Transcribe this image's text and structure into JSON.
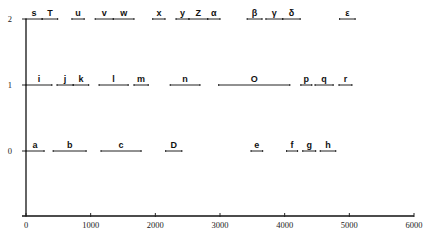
{
  "chart_data": {
    "type": "gantt-interval",
    "title": "",
    "xlabel": "",
    "ylabel": "",
    "xlim": [
      0,
      6000
    ],
    "ylim": [
      -1,
      2
    ],
    "grid": false,
    "x_ticks": [
      0,
      1000,
      2000,
      3000,
      4000,
      5000,
      6000
    ],
    "y_ticks": [
      0,
      1,
      2
    ],
    "levels": [
      {
        "y": 2,
        "intervals": [
          {
            "label": "s",
            "start": 0,
            "end": 250
          },
          {
            "label": "T",
            "start": 250,
            "end": 490
          },
          {
            "label": "u",
            "start": 710,
            "end": 900
          },
          {
            "label": "v",
            "start": 1070,
            "end": 1350
          },
          {
            "label": "w",
            "start": 1350,
            "end": 1670
          },
          {
            "label": "x",
            "start": 1960,
            "end": 2150
          },
          {
            "label": "y",
            "start": 2320,
            "end": 2520
          },
          {
            "label": "Z",
            "start": 2520,
            "end": 2810
          },
          {
            "label": "α",
            "start": 2810,
            "end": 3000
          },
          {
            "label": "β",
            "start": 3420,
            "end": 3650
          },
          {
            "label": "γ",
            "start": 3710,
            "end": 3970
          },
          {
            "label": "δ",
            "start": 3970,
            "end": 4240
          },
          {
            "label": "ε",
            "start": 4850,
            "end": 5090
          }
        ]
      },
      {
        "y": 1,
        "intervals": [
          {
            "label": "i",
            "start": 0,
            "end": 400
          },
          {
            "label": "j",
            "start": 480,
            "end": 730
          },
          {
            "label": "k",
            "start": 730,
            "end": 970
          },
          {
            "label": "l",
            "start": 1130,
            "end": 1580
          },
          {
            "label": "m",
            "start": 1670,
            "end": 1890
          },
          {
            "label": "n",
            "start": 2230,
            "end": 2690
          },
          {
            "label": "O",
            "start": 2980,
            "end": 4080
          },
          {
            "label": "p",
            "start": 4250,
            "end": 4420
          },
          {
            "label": "q",
            "start": 4470,
            "end": 4750
          },
          {
            "label": "r",
            "start": 4840,
            "end": 5040
          }
        ]
      },
      {
        "y": 0,
        "intervals": [
          {
            "label": "a",
            "start": 0,
            "end": 280
          },
          {
            "label": "b",
            "start": 420,
            "end": 930
          },
          {
            "label": "c",
            "start": 1160,
            "end": 1780
          },
          {
            "label": "D",
            "start": 2160,
            "end": 2410
          },
          {
            "label": "e",
            "start": 3480,
            "end": 3660
          },
          {
            "label": "f",
            "start": 4030,
            "end": 4200
          },
          {
            "label": "g",
            "start": 4280,
            "end": 4480
          },
          {
            "label": "h",
            "start": 4550,
            "end": 4790
          }
        ]
      }
    ]
  }
}
